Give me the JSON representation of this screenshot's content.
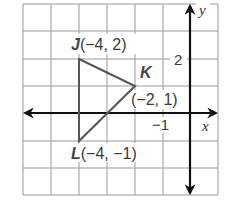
{
  "diagram": {
    "type": "coordinate-plane",
    "colors": {
      "grid": "#9a9a9a",
      "axes": "#111111",
      "triangle": "#555555",
      "text": "#3a3a3a"
    },
    "axes": {
      "x_label": "x",
      "y_label": "y",
      "x_tick_label": "−1",
      "y_tick_label": "2",
      "x_range": [
        -6,
        1
      ],
      "y_range": [
        -3,
        4
      ]
    },
    "triangle": {
      "vertices": [
        {
          "name": "J",
          "coords": "(−4, 2)",
          "x": -4,
          "y": 2
        },
        {
          "name": "K",
          "coords": "(−2, 1)",
          "x": -2,
          "y": 1
        },
        {
          "name": "L",
          "coords": "(−4, −1)",
          "x": -4,
          "y": -1
        }
      ]
    }
  }
}
